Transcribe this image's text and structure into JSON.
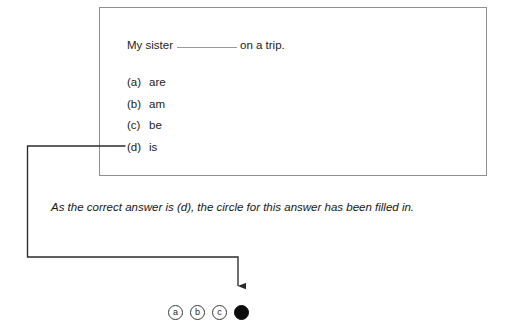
{
  "document": {
    "type": "multiple-choice-example",
    "question_box": {
      "stem_before_blank": "My sister",
      "blank": "__________",
      "stem_after_blank": "on a trip.",
      "options": [
        {
          "letter": "(a)",
          "text": "are"
        },
        {
          "letter": "(b)",
          "text": "am"
        },
        {
          "letter": "(c)",
          "text": "be"
        },
        {
          "letter": "(d)",
          "text": "is"
        }
      ]
    },
    "caption": "As the correct answer is (d), the circle for this answer has been filled in.",
    "answer_row": {
      "bubbles": [
        {
          "label": "a",
          "filled": false
        },
        {
          "label": "b",
          "filled": false
        },
        {
          "label": "c",
          "filled": false
        },
        {
          "label": "d",
          "filled": true
        }
      ]
    },
    "colors": {
      "box_border": "#8f8f8f",
      "text": "#1c1c1c",
      "connector": "#2b2b2b",
      "filled_bubble": "#0c0c0c",
      "blank_rule": "#9a9a9a",
      "background": "#ffffff"
    }
  }
}
